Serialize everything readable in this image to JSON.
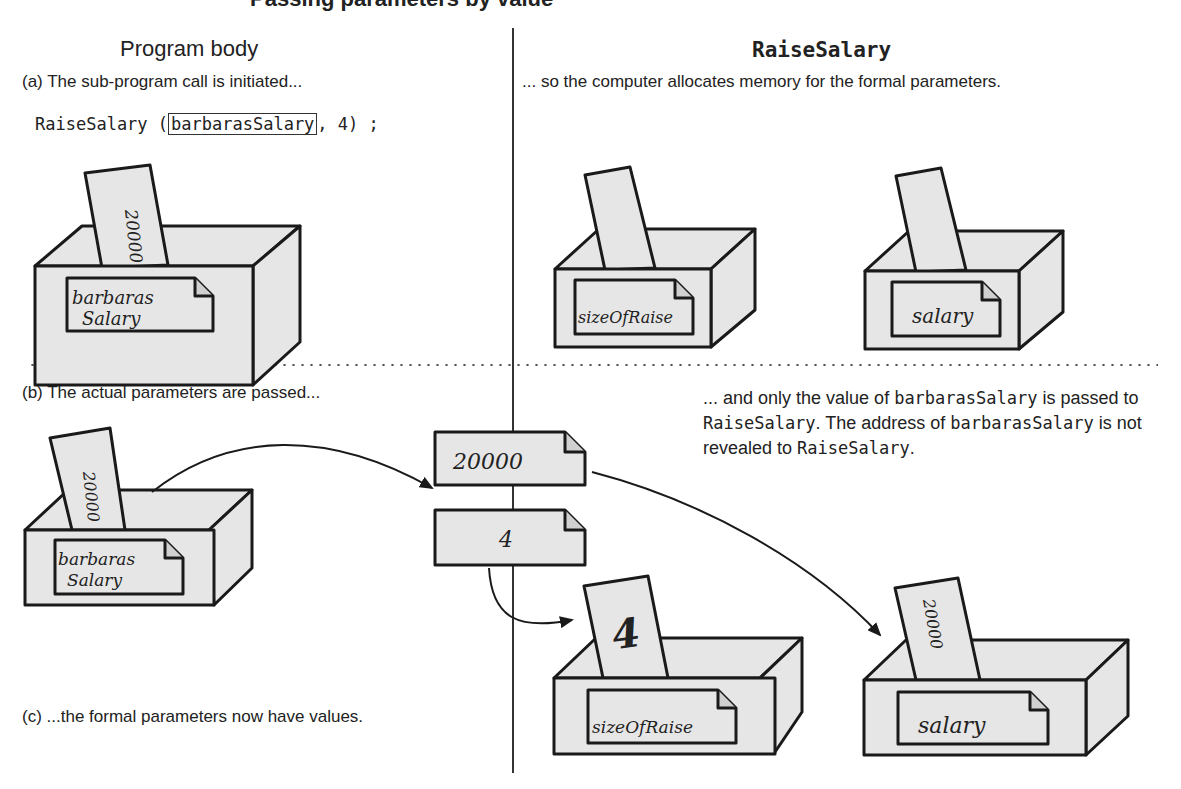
{
  "figure": {
    "title_cut": "Passing parameters by value",
    "columns": {
      "left_heading": "Program body",
      "right_heading": "RaiseSalary"
    },
    "steps": {
      "a_left": "(a) The sub-program call is initiated...",
      "a_right": "... so the computer allocates memory for the formal parameters.",
      "b_left": "(b) The actual parameters are passed...",
      "b_right": {
        "t1": "... and only the value of ",
        "m1": "barbarasSalary",
        "t2": " is passed to ",
        "m2": "RaiseSalary",
        "t3": ". The address of ",
        "m3": "barbarasSalary",
        "t4": " is not revealed to ",
        "m4": "RaiseSalary",
        "t5": "."
      },
      "c_left": "(c) ...the formal parameters now have values."
    },
    "code_call": {
      "prefix": "RaiseSalary (",
      "highlighted_arg": "barbarasSalary",
      "suffix": ", 4) ;"
    },
    "boxes": {
      "a_actual": {
        "label_line1": "barbaras",
        "label_line2": "Salary",
        "card_value": "20000"
      },
      "a_formal_1": {
        "label": "sizeOfRaise",
        "card_value": ""
      },
      "a_formal_2": {
        "label": "salary",
        "card_value": ""
      },
      "b_actual": {
        "label_line1": "barbaras",
        "label_line2": "Salary",
        "card_value": "20000"
      },
      "c_formal_1": {
        "label": "sizeOfRaise",
        "card_value": "4"
      },
      "c_formal_2": {
        "label": "salary",
        "card_value": "20000"
      }
    },
    "passed_values": [
      "20000",
      "4"
    ],
    "colors": {
      "box_fill": "#e6e6e6",
      "stroke": "#1a1a1a",
      "background": "#ffffff"
    }
  }
}
